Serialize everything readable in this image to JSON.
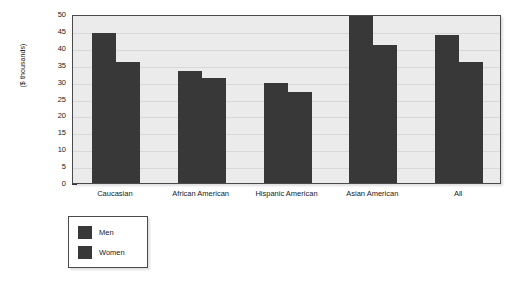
{
  "chart_data": {
    "type": "bar",
    "title": "",
    "subtitle": "",
    "xlabel": "",
    "ylabel": "($ thousands)",
    "categories": [
      "Caucasian",
      "African American",
      "Hispanic American",
      "Asian American",
      "All"
    ],
    "series": [
      {
        "name": "Men",
        "values": [
          44.3,
          33.2,
          29.5,
          49.5,
          43.7
        ]
      },
      {
        "name": "Women",
        "values": [
          35.7,
          31.0,
          26.9,
          40.8,
          35.7
        ]
      }
    ],
    "ylim": [
      0,
      50
    ],
    "yticks": [
      0,
      5,
      10,
      15,
      20,
      25,
      30,
      35,
      40,
      45,
      50
    ],
    "ytick_labels": [
      "0",
      "5",
      "10",
      "15",
      "20",
      "25",
      "30",
      "35",
      "40",
      "45",
      "50"
    ],
    "grid": true,
    "legend_position": "below-left",
    "legend_entries": [
      "Men",
      "Women"
    ],
    "bar_color": "#383838",
    "plot_background": "#ebebeb",
    "gridline_color": "#d8d8d8",
    "frame_color": "#4a4a4a"
  }
}
